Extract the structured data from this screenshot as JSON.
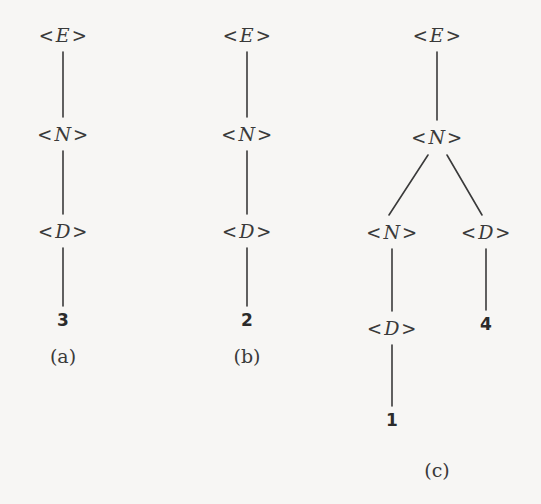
{
  "figure": {
    "background_color": "#f7f6f4",
    "stroke_color": "#3a3a3a",
    "text_color": "#3a3a3a",
    "terminal_color": "#2b2b2b"
  },
  "open_bracket": "<",
  "close_bracket": ">",
  "trees": [
    {
      "id": "tree-a",
      "caption": "(a)",
      "caption_pos": {
        "x": 63,
        "y": 356
      },
      "nodes": [
        {
          "name": "node-a-e",
          "symbol": "E",
          "x": 63,
          "y": 35
        },
        {
          "name": "node-a-n",
          "symbol": "N",
          "x": 63,
          "y": 134
        },
        {
          "name": "node-a-d",
          "symbol": "D",
          "x": 63,
          "y": 231
        }
      ],
      "terminals": [
        {
          "name": "terminal-a-3",
          "value": "3",
          "x": 63,
          "y": 320
        }
      ],
      "edges": [
        {
          "name": "edge-a-e-n",
          "x1": 63,
          "y1": 52,
          "x2": 63,
          "y2": 117
        },
        {
          "name": "edge-a-n-d",
          "x1": 63,
          "y1": 151,
          "x2": 63,
          "y2": 214
        },
        {
          "name": "edge-a-d-3",
          "x1": 63,
          "y1": 248,
          "x2": 63,
          "y2": 306
        }
      ]
    },
    {
      "id": "tree-b",
      "caption": "(b)",
      "caption_pos": {
        "x": 247,
        "y": 356
      },
      "nodes": [
        {
          "name": "node-b-e",
          "symbol": "E",
          "x": 247,
          "y": 35
        },
        {
          "name": "node-b-n",
          "symbol": "N",
          "x": 247,
          "y": 134
        },
        {
          "name": "node-b-d",
          "symbol": "D",
          "x": 247,
          "y": 231
        }
      ],
      "terminals": [
        {
          "name": "terminal-b-2",
          "value": "2",
          "x": 247,
          "y": 320
        }
      ],
      "edges": [
        {
          "name": "edge-b-e-n",
          "x1": 247,
          "y1": 52,
          "x2": 247,
          "y2": 117
        },
        {
          "name": "edge-b-n-d",
          "x1": 247,
          "y1": 151,
          "x2": 247,
          "y2": 214
        },
        {
          "name": "edge-b-d-2",
          "x1": 247,
          "y1": 248,
          "x2": 247,
          "y2": 306
        }
      ]
    },
    {
      "id": "tree-c",
      "caption": "(c)",
      "caption_pos": {
        "x": 437,
        "y": 470
      },
      "nodes": [
        {
          "name": "node-c-e",
          "symbol": "E",
          "x": 437,
          "y": 35
        },
        {
          "name": "node-c-n-root",
          "symbol": "N",
          "x": 437,
          "y": 137
        },
        {
          "name": "node-c-n-left",
          "symbol": "N",
          "x": 392,
          "y": 232
        },
        {
          "name": "node-c-d-right",
          "symbol": "D",
          "x": 486,
          "y": 232
        },
        {
          "name": "node-c-d-left",
          "symbol": "D",
          "x": 392,
          "y": 328
        }
      ],
      "terminals": [
        {
          "name": "terminal-c-4",
          "value": "4",
          "x": 486,
          "y": 324
        },
        {
          "name": "terminal-c-1",
          "value": "1",
          "x": 392,
          "y": 420
        }
      ],
      "edges": [
        {
          "name": "edge-c-e-n",
          "x1": 437,
          "y1": 52,
          "x2": 437,
          "y2": 120
        },
        {
          "name": "edge-c-n-nleft",
          "x1": 428,
          "y1": 155,
          "x2": 389,
          "y2": 215
        },
        {
          "name": "edge-c-n-dright",
          "x1": 447,
          "y1": 155,
          "x2": 482,
          "y2": 215
        },
        {
          "name": "edge-c-nleft-dleft",
          "x1": 392,
          "y1": 249,
          "x2": 392,
          "y2": 311
        },
        {
          "name": "edge-c-dleft-1",
          "x1": 392,
          "y1": 345,
          "x2": 392,
          "y2": 406
        },
        {
          "name": "edge-c-dright-4",
          "x1": 486,
          "y1": 249,
          "x2": 486,
          "y2": 310
        }
      ]
    }
  ]
}
